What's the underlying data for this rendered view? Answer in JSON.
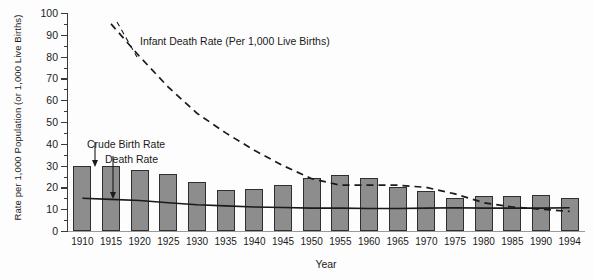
{
  "chart_data": {
    "type": "bar",
    "title": "",
    "xlabel": "Year",
    "ylabel": "Rate per 1,000 Population (or 1,000 Live Births)",
    "ylim": [
      0,
      100
    ],
    "ytick_step": 10,
    "yminor_step": 5,
    "grid": false,
    "legend": "none",
    "categories": [
      "1910",
      "1915",
      "1920",
      "1925",
      "1930",
      "1935",
      "1940",
      "1945",
      "1950",
      "1955",
      "1960",
      "1965",
      "1970",
      "1975",
      "1980",
      "1985",
      "1990",
      "1994"
    ],
    "ytick_labels": [
      "0",
      "10",
      "20",
      "30",
      "40",
      "50",
      "60",
      "70",
      "80",
      "90",
      "100"
    ],
    "series": [
      {
        "name": "Crude Birth Rate",
        "render": "bar",
        "color": "#8d8d8d",
        "values": [
          30,
          30,
          28,
          26,
          22.5,
          19,
          19.5,
          21,
          24.5,
          25.5,
          24.5,
          20,
          18.5,
          15,
          16,
          16,
          16.5,
          15
        ]
      },
      {
        "name": "Death Rate",
        "render": "line-solid",
        "color": "#1a1a1a",
        "values": [
          15,
          14.5,
          14,
          13,
          12,
          11.5,
          11,
          10.8,
          10.5,
          10.5,
          10.3,
          10.3,
          10.5,
          10.7,
          10.5,
          10.5,
          10.5,
          10.7
        ]
      },
      {
        "name": "Infant Death Rate (Per 1,000 Live Births)",
        "render": "line-dashed",
        "color": "#1a1a1a",
        "start_category": "1915",
        "values": [
          null,
          95,
          80,
          66,
          54,
          45,
          37,
          30,
          24,
          21,
          21,
          21,
          20,
          17,
          13,
          11,
          10,
          9
        ]
      }
    ],
    "annotations": [
      {
        "name": "infant-death-rate-label",
        "text": "Infant Death Rate (Per 1,000 Live Births)"
      },
      {
        "name": "crude-birth-rate-label",
        "text": "Crude Birth Rate"
      },
      {
        "name": "death-rate-label",
        "text": "Death Rate"
      }
    ]
  }
}
